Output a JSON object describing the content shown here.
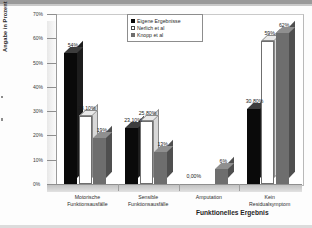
{
  "chart_data": {
    "type": "bar",
    "title": "",
    "xlabel": "Funktionelles Ergebnis",
    "ylabel": "Angabe in Prozent",
    "categories": [
      "Motorische Funktionsausfälle",
      "Sensible Funktionsausfälle",
      "Amputation",
      "Kein Residualsymptom"
    ],
    "series": [
      {
        "name": "Eigene Ergebnisse",
        "color": "#0a0a0a",
        "values": [
          54,
          23.1,
          0,
          30.8
        ],
        "labels": [
          "54%",
          "23,10%",
          "0,00%",
          "30,80%"
        ]
      },
      {
        "name": "Nerlich et al",
        "color": "#ffffff",
        "values": [
          28.1,
          25.8,
          null,
          59
        ],
        "labels": [
          "28,10%",
          "25,80%",
          "",
          "59%"
        ]
      },
      {
        "name": "Knopp et al",
        "color": "#6e6e6e",
        "values": [
          19,
          13,
          6,
          62
        ],
        "labels": [
          "19%",
          "13%",
          "6%",
          "62%"
        ]
      }
    ],
    "ylim": [
      0,
      70
    ],
    "yticks": [
      "0%",
      "10%",
      "20%",
      "30%",
      "40%",
      "50%",
      "60%",
      "70%"
    ],
    "ytick_values": [
      0,
      10,
      20,
      30,
      40,
      50,
      60,
      70
    ],
    "grid": false,
    "legend_position": "top-center",
    "style": "3d-column"
  }
}
